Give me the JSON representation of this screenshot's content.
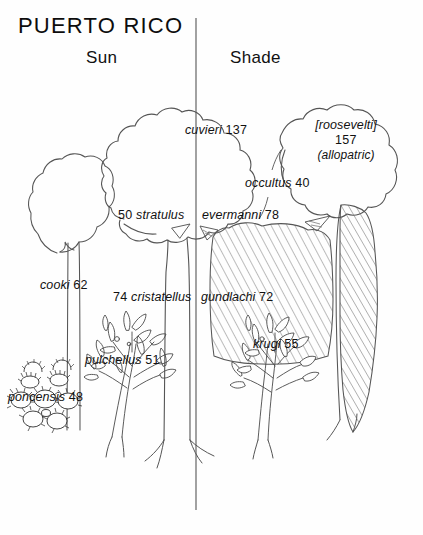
{
  "figure": {
    "title": "PUERTO RICO",
    "columns": [
      {
        "name": "sun",
        "label": "Sun"
      },
      {
        "name": "shade",
        "label": "Shade"
      }
    ]
  },
  "taxa": [
    {
      "key": "cuvieri",
      "prefix": "",
      "name": "cuvieri",
      "value": "137",
      "habitat": "shade"
    },
    {
      "key": "roosevelti",
      "prefix": "",
      "name": "[roosevelti]",
      "value": "157",
      "note": "(allopatric)",
      "habitat": "shade"
    },
    {
      "key": "occultus",
      "prefix": "",
      "name": "occultus",
      "value": "40",
      "habitat": "shade"
    },
    {
      "key": "stratulus",
      "prefix": "50",
      "name": "stratulus",
      "value": "",
      "habitat": "sun"
    },
    {
      "key": "evermanni",
      "prefix": "",
      "name": "evermanni",
      "value": "78",
      "habitat": "shade"
    },
    {
      "key": "cooki",
      "prefix": "",
      "name": "cooki",
      "value": "62",
      "habitat": "sun"
    },
    {
      "key": "cristatellus",
      "prefix": "74",
      "name": "cristatellus",
      "value": "",
      "habitat": "sun"
    },
    {
      "key": "gundlachi",
      "prefix": "",
      "name": "gundlachi",
      "value": "72",
      "habitat": "shade"
    },
    {
      "key": "pulchellus",
      "prefix": "",
      "name": "pulchellus",
      "value": "51",
      "habitat": "sun"
    },
    {
      "key": "krugi",
      "prefix": "",
      "name": "krugi",
      "value": "55",
      "habitat": "shade"
    },
    {
      "key": "poncensis",
      "prefix": "",
      "name": "poncensis",
      "value": "48",
      "habitat": "sun"
    }
  ],
  "colors": {
    "ink": "#111111",
    "line": "#555555",
    "hatch": "#6a6a6a",
    "background": "#fefefe"
  }
}
